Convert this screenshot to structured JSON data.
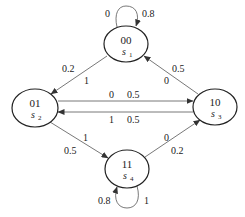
{
  "diagram": {
    "type": "state-transition",
    "nodes": [
      {
        "id": "s1",
        "code": "00",
        "name": "s",
        "sub": "1",
        "cx": 126,
        "cy": 44
      },
      {
        "id": "s2",
        "code": "01",
        "name": "s",
        "sub": "2",
        "cx": 35,
        "cy": 108
      },
      {
        "id": "s3",
        "code": "10",
        "name": "s",
        "sub": "3",
        "cx": 215,
        "cy": 107
      },
      {
        "id": "s4",
        "code": "11",
        "name": "s",
        "sub": "4",
        "cx": 127,
        "cy": 169
      }
    ],
    "edges": [
      {
        "from": "s1",
        "to": "s1",
        "input": "0",
        "prob": "0.8"
      },
      {
        "from": "s1",
        "to": "s2",
        "input": "1",
        "prob": "0.2"
      },
      {
        "from": "s3",
        "to": "s1",
        "input": "0",
        "prob": "0.5"
      },
      {
        "from": "s2",
        "to": "s3",
        "input": "0",
        "prob": "0.5"
      },
      {
        "from": "s3",
        "to": "s2",
        "input": "1",
        "prob": "0.5"
      },
      {
        "from": "s4",
        "to": "s2",
        "input": "1",
        "prob": "0.5"
      },
      {
        "from": "s4",
        "to": "s3",
        "input": "0",
        "prob": "0.2"
      },
      {
        "from": "s4",
        "to": "s4",
        "input": "1",
        "prob": "0.8"
      }
    ],
    "labels": {
      "s1_loop_in": "0",
      "s1_loop_prob": "0.8",
      "s1_s2_prob": "0.2",
      "s1_s2_in": "1",
      "s3_s1_prob": "0.5",
      "s3_s1_in": "0",
      "s2_s3_in": "0",
      "s2_s3_prob": "0.5",
      "s3_s2_in": "1",
      "s3_s2_prob": "0.5",
      "s4_s2_in": "1",
      "s4_s2_prob": "0.5",
      "s4_s3_in": "0",
      "s4_s3_prob": "0.2",
      "s4_loop_prob": "0.8",
      "s4_loop_in": "1"
    }
  }
}
